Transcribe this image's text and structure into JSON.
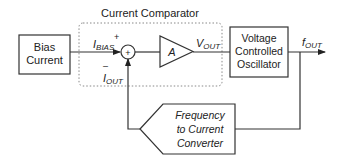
{
  "diagram": {
    "comparator_group": {
      "title": "Current Comparator"
    },
    "bias_block": {
      "line1": "Bias",
      "line2": "Current"
    },
    "summing_node": {
      "symbol": "+",
      "plus_sign": "+",
      "minus_sign": "–"
    },
    "amplifier": {
      "label": "A"
    },
    "vco_block": {
      "line1": "Voltage",
      "line2": "Controlled",
      "line3": "Oscillator"
    },
    "converter_block": {
      "line1": "Frequency",
      "line2": "to Current",
      "line3": "Converter"
    },
    "signals": {
      "i_bias": {
        "main": "I",
        "sub": "BIAS"
      },
      "i_out": {
        "main": "I",
        "sub": "OUT"
      },
      "v_out": {
        "main": "V",
        "sub": "OUT"
      },
      "f_out": {
        "main": "f",
        "sub": "OUT"
      }
    }
  }
}
